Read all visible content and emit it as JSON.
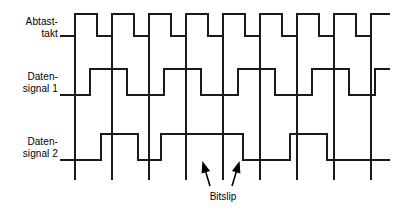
{
  "figure": {
    "kind": "digital-timing-diagram",
    "width": 408,
    "height": 213,
    "background_color": "#ffffff",
    "line_color": "#1a1a1a",
    "text_color": "#000000"
  },
  "labels": {
    "clock": "Abtast-\ntakt",
    "clock_line1": "Abtast-",
    "clock_line2": "takt",
    "data1": "Daten-\nsignal 1",
    "data1_line1": "Daten-",
    "data1_line2": "signal 1",
    "data2": "Daten-\nsignal 2",
    "data2_line1": "Daten-",
    "data2_line2": "signal 2"
  },
  "annotations": {
    "bitslip": "Bitslip"
  },
  "chart_data": {
    "type": "line",
    "title": "",
    "xlabel": "",
    "ylabel": "",
    "grid": false,
    "legend_position": "left",
    "plot_area": {
      "x0": 60,
      "x1": 392,
      "y_top": 12,
      "y_bottom": 186
    },
    "time_axis": {
      "unit": "px",
      "start": 60,
      "end": 392,
      "clock_period": 37.0,
      "first_rising_edge": 75,
      "sampling_edges": [
        75,
        112,
        149,
        186,
        223,
        260,
        297,
        334,
        371
      ]
    },
    "series": [
      {
        "name": "Abtasttakt",
        "label": "Abtast-\ntakt",
        "row_index": 0,
        "high_y": 14,
        "low_y": 36,
        "initial_level": 0,
        "start_x": 60,
        "end_x": 390,
        "transitions": [
          {
            "x": 75,
            "level": 1
          },
          {
            "x": 97,
            "level": 0
          },
          {
            "x": 112,
            "level": 1
          },
          {
            "x": 134,
            "level": 0
          },
          {
            "x": 149,
            "level": 1
          },
          {
            "x": 171,
            "level": 0
          },
          {
            "x": 186,
            "level": 1
          },
          {
            "x": 208,
            "level": 0
          },
          {
            "x": 223,
            "level": 1
          },
          {
            "x": 245,
            "level": 0
          },
          {
            "x": 260,
            "level": 1
          },
          {
            "x": 282,
            "level": 0
          },
          {
            "x": 297,
            "level": 1
          },
          {
            "x": 319,
            "level": 0
          },
          {
            "x": 334,
            "level": 1
          },
          {
            "x": 356,
            "level": 0
          },
          {
            "x": 371,
            "level": 1
          }
        ],
        "bits": [
          1,
          1,
          1,
          1,
          1,
          1,
          1,
          1,
          1
        ]
      },
      {
        "name": "Datensignal 1",
        "label": "Daten-\nsignal 1",
        "row_index": 1,
        "high_y": 69,
        "low_y": 95,
        "initial_level": 0,
        "start_x": 60,
        "end_x": 390,
        "transitions": [
          {
            "x": 90,
            "level": 1
          },
          {
            "x": 127,
            "level": 0
          },
          {
            "x": 164,
            "level": 1
          },
          {
            "x": 201,
            "level": 0
          },
          {
            "x": 238,
            "level": 1
          },
          {
            "x": 275,
            "level": 0
          },
          {
            "x": 312,
            "level": 1
          },
          {
            "x": 349,
            "level": 0
          },
          {
            "x": 375,
            "level": 1
          }
        ],
        "bits": [
          0,
          1,
          0,
          1,
          0,
          1,
          0,
          1,
          0
        ]
      },
      {
        "name": "Datensignal 2",
        "label": "Daten-\nsignal 2",
        "row_index": 2,
        "high_y": 134,
        "low_y": 160,
        "initial_level": 0,
        "start_x": 60,
        "end_x": 390,
        "transitions": [
          {
            "x": 101,
            "level": 1
          },
          {
            "x": 138,
            "level": 0
          },
          {
            "x": 161,
            "level": 1
          },
          {
            "x": 243,
            "level": 0
          },
          {
            "x": 290,
            "level": 1
          },
          {
            "x": 327,
            "level": 0
          }
        ],
        "bits": [
          0,
          1,
          0,
          1,
          1,
          0,
          1,
          0
        ]
      }
    ],
    "sampling_lines": {
      "description": "vertical sampling lines at clock rising edges",
      "y_top": 36,
      "y_bottom": 180,
      "x_positions": [
        75,
        112,
        149,
        186,
        223,
        260,
        297,
        334,
        371
      ]
    },
    "bitslip_marker": {
      "label": "Bitslip",
      "left_edge_x": 198,
      "right_edge_x": 243,
      "arrow_left": {
        "tip_x": 203,
        "tip_y": 163,
        "tail_x": 210,
        "tail_y": 186
      },
      "arrow_right": {
        "tip_x": 239,
        "tip_y": 163,
        "tail_x": 232,
        "tail_y": 186
      },
      "text_x": 223,
      "text_y": 196
    }
  }
}
